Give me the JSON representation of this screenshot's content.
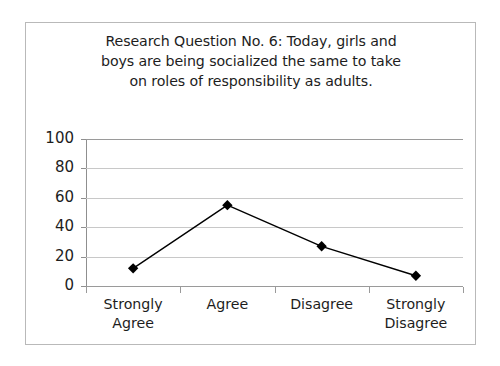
{
  "card": {
    "border_color": "#b9b9b9",
    "background": "#ffffff"
  },
  "chart_data": {
    "type": "line",
    "title": "Research Question No. 6:  Today, girls and\nboys are being socialized the same to take\non roles of responsibility as adults.",
    "title_lines": [
      "Research Question No. 6:  Today, girls and",
      "boys are being socialized the same to take",
      "on roles of responsibility as adults."
    ],
    "categories": [
      "Strongly\nAgree",
      "Agree",
      "Disagree",
      "Strongly\nDisagree"
    ],
    "category_labels_flat": [
      "Strongly Agree",
      "Agree",
      "Disagree",
      "Strongly Disagree"
    ],
    "values": [
      12,
      55,
      27,
      7
    ],
    "xlabel": "",
    "ylabel": "",
    "ylim": [
      0,
      100
    ],
    "yticks": [
      0,
      20,
      40,
      60,
      80,
      100
    ],
    "ytick_labels": [
      "0",
      "20",
      "40",
      "60",
      "80",
      "100"
    ],
    "grid": true,
    "grid_color": "#c8c8c8",
    "legend": false,
    "series_color": "#000000",
    "marker": "diamond",
    "marker_color": "#000000"
  }
}
